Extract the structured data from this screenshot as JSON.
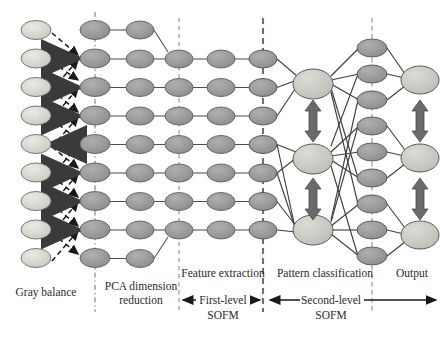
{
  "figure": {
    "kind": "neural-network-architecture-diagram",
    "width": 444,
    "height": 341,
    "background": "#ffffff"
  },
  "colors": {
    "node_light": "#d2d2cc",
    "node_mid": "#9a9a9a",
    "node_dark_edge": "#6b6b6b",
    "node_outline": "#555555",
    "edge_line": "#4a4a4a",
    "thick_arrow": "#5a5a5a",
    "dashed_arrow": "#1a1a1a",
    "divider": "#8a8a8a",
    "text": "#2b2b2b"
  },
  "stage_labels": [
    {
      "id": "gray-balance",
      "text": "Gray balance",
      "x": 46,
      "y": 296
    },
    {
      "id": "pca-line1",
      "text": "PCA dimension",
      "x": 141,
      "y": 290
    },
    {
      "id": "pca-line2",
      "text": "reduction",
      "x": 141,
      "y": 304
    },
    {
      "id": "feature-extraction",
      "text": "Feature extraction",
      "x": 223,
      "y": 277
    },
    {
      "id": "pattern-classification",
      "text": "Pattern  classification",
      "x": 325,
      "y": 277
    },
    {
      "id": "output",
      "text": "Output",
      "x": 412,
      "y": 277
    }
  ],
  "span_labels": [
    {
      "id": "first-level-line1",
      "text": "First-level",
      "x": 223,
      "y": 302
    },
    {
      "id": "first-level-line2",
      "text": "SOFM",
      "x": 223,
      "y": 318
    },
    {
      "id": "second-level-line1",
      "text": "Second-level",
      "x": 331,
      "y": 302
    },
    {
      "id": "second-level-line2",
      "text": "SOFM",
      "x": 331,
      "y": 318
    }
  ],
  "dividers": [
    {
      "id": "divider-pca",
      "x": 95,
      "y1": 12,
      "y2": 312,
      "style": "dash-dot"
    },
    {
      "id": "divider-feature",
      "x": 179,
      "y1": 18,
      "y2": 312,
      "style": "dashed"
    },
    {
      "id": "divider-pattern",
      "x": 263,
      "y1": 18,
      "y2": 312,
      "style": "dashed-bold"
    },
    {
      "id": "divider-output",
      "x": 372,
      "y1": 18,
      "y2": 312,
      "style": "dashed"
    }
  ],
  "columns": [
    {
      "id": "col-input",
      "name": "gray-balance-input-layer",
      "x": 36,
      "count": 9,
      "y0": 30,
      "dy": 28.5,
      "rx": 15,
      "ry": 9.5,
      "fill": "#d7d7d0"
    },
    {
      "id": "col-pca",
      "name": "pca-layer",
      "x": 95,
      "count": 9,
      "y0": 30,
      "dy": 28.5,
      "rx": 15,
      "ry": 9.5,
      "fill": "#9c9c9c"
    },
    {
      "id": "col-sofm1a",
      "name": "sofm1-layer-a",
      "x": 140,
      "count": 7,
      "y0": 59,
      "dy": 28.5,
      "rx": 14,
      "ry": 9,
      "fill": "#9c9c9c"
    },
    {
      "id": "col-sofm1b",
      "name": "sofm1-layer-b",
      "x": 179,
      "count": 7,
      "y0": 59,
      "dy": 28.5,
      "rx": 14,
      "ry": 9,
      "fill": "#9c9c9c"
    },
    {
      "id": "col-sofm1c",
      "name": "sofm1-layer-c",
      "x": 221,
      "count": 7,
      "y0": 59,
      "dy": 28.5,
      "rx": 14,
      "ry": 9,
      "fill": "#9c9c9c"
    },
    {
      "id": "col-feature",
      "name": "feature-output-layer",
      "x": 263,
      "count": 7,
      "y0": 59,
      "dy": 28.5,
      "rx": 14,
      "ry": 9,
      "fill": "#8f8f8f"
    },
    {
      "id": "col-pattern",
      "name": "pattern-classification-layer",
      "x": 313,
      "count": 3,
      "y0": 80,
      "dy": 78,
      "rx": 20,
      "ry": 15,
      "fill": "#c9c9c2"
    },
    {
      "id": "col-hidden",
      "name": "second-sofm-hidden-layer",
      "x": 372,
      "count": 9,
      "y0": 48,
      "dy": 26,
      "rx": 15,
      "ry": 9,
      "fill": "#8f8f8f"
    },
    {
      "id": "col-output",
      "name": "output-layer",
      "x": 420,
      "count": 3,
      "y0": 80,
      "dy": 78,
      "rx": 18,
      "ry": 14,
      "fill": "#c9c9c2"
    }
  ],
  "straight_links": {
    "note": "horizontal chains between pca -> sofm1a -> sofm1b -> sofm1c -> feature",
    "rows": 7
  },
  "thick_arrows": {
    "name": "gray-balance-correction-arrows",
    "count": 7,
    "color": "#5a5a5a"
  },
  "dashed_arrows": {
    "name": "gray-balance-crosslinks",
    "color": "#1a1a1a"
  },
  "vertical_double_arrows": [
    {
      "id": "pattern-arrow-1",
      "x": 313,
      "y1": 100,
      "y2": 142
    },
    {
      "id": "pattern-arrow-2",
      "x": 313,
      "y1": 178,
      "y2": 220
    },
    {
      "id": "output-arrow-1",
      "x": 420,
      "y1": 100,
      "y2": 142
    },
    {
      "id": "output-arrow-2",
      "x": 420,
      "y1": 178,
      "y2": 220
    }
  ],
  "span_arrows": [
    {
      "id": "first-level-span",
      "x1": 181,
      "x2": 261,
      "y": 300,
      "heads": "both"
    },
    {
      "id": "second-level-span",
      "x1": 265,
      "x2": 438,
      "y": 300,
      "heads": "both"
    }
  ]
}
